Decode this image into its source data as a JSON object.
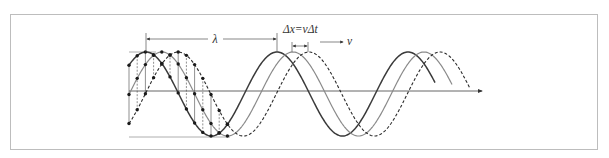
{
  "figure": {
    "caption_faded": "",
    "labels": {
      "wavelength": "λ",
      "displacement_eq": "Δx=vΔt",
      "velocity": "v"
    },
    "colors": {
      "frame": "#bdbdbd",
      "wave_current": "#3a3a3a",
      "wave_next": "#7a7a7a",
      "wave_later": "#2a2a2a",
      "axis": "#555555",
      "reference_lines": "#9a9a9a",
      "points": "#1a1a1a"
    },
    "waves": [
      {
        "name": "wave-t0",
        "style": "solid-dark",
        "phase_offset_px": 0
      },
      {
        "name": "wave-t1",
        "style": "solid-gray",
        "phase_offset_px": 16
      },
      {
        "name": "wave-t2",
        "style": "dashed",
        "phase_offset_px": 32
      }
    ],
    "geometry": {
      "period_px": 131,
      "amplitude_px": 42,
      "center_y": 94,
      "first_crest_x": 146,
      "axis_y": 91
    }
  }
}
